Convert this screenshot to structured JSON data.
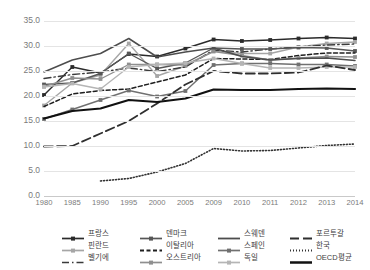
{
  "chart_data": {
    "type": "line",
    "title": "",
    "xlabel": "",
    "ylabel": "",
    "categories": [
      "1980",
      "1985",
      "1990",
      "1995",
      "2000",
      "2005",
      "2009",
      "2010",
      "2011",
      "2012",
      "2013",
      "2014"
    ],
    "ylim": [
      0,
      35
    ],
    "yticks": [
      "0.0",
      "5.0",
      "10.0",
      "15.0",
      "20.0",
      "25.0",
      "30.0",
      "35.0"
    ],
    "grid": true,
    "legend_position": "bottom",
    "series": [
      {
        "name": "프랑스",
        "color": "#2b2b2b",
        "style": "solid-marker",
        "values": [
          20.2,
          25.8,
          24.6,
          28.4,
          27.9,
          29.5,
          31.3,
          31.0,
          31.2,
          31.5,
          31.7,
          31.5
        ]
      },
      {
        "name": "핀란드",
        "color": "#a6a6a6",
        "style": "solid-marker",
        "values": [
          18.1,
          22.6,
          24.2,
          30.5,
          24.0,
          26.0,
          29.0,
          28.5,
          28.5,
          29.8,
          30.5,
          30.8
        ]
      },
      {
        "name": "벨기에",
        "color": "#3a3a3a",
        "style": "dashdot",
        "values": [
          23.5,
          24.3,
          24.8,
          25.6,
          24.9,
          25.8,
          29.2,
          28.8,
          29.4,
          29.8,
          30.2,
          30.4
        ]
      },
      {
        "name": "덴마크",
        "color": "#565656",
        "style": "solid-marker",
        "values": [
          22.3,
          22.6,
          24.5,
          28.5,
          25.5,
          26.6,
          29.6,
          29.4,
          29.4,
          29.7,
          29.6,
          29.0
        ]
      },
      {
        "name": "이탈리아",
        "color": "#1f1f1f",
        "style": "dotted-dash",
        "values": [
          17.9,
          20.4,
          21.1,
          21.4,
          22.8,
          24.2,
          27.5,
          27.4,
          27.3,
          28.1,
          28.6,
          28.6
        ]
      },
      {
        "name": "오스트리아",
        "color": "#8f8f8f",
        "style": "solid-marker",
        "values": [
          21.9,
          23.6,
          23.4,
          26.3,
          26.3,
          26.2,
          28.9,
          28.1,
          27.2,
          27.6,
          27.9,
          27.8
        ]
      },
      {
        "name": "스웨덴",
        "color": "#4d4d4d",
        "style": "solid",
        "values": [
          24.8,
          27.2,
          28.5,
          31.5,
          27.8,
          28.8,
          29.6,
          27.9,
          27.2,
          27.5,
          27.6,
          27.1
        ]
      },
      {
        "name": "스페인",
        "color": "#707070",
        "style": "solid-marker",
        "values": [
          15.4,
          17.3,
          19.2,
          21.1,
          19.9,
          21.0,
          26.2,
          26.5,
          26.5,
          26.3,
          26.3,
          26.0
        ]
      },
      {
        "name": "독일",
        "color": "#b5b5b5",
        "style": "solid-marker",
        "values": [
          21.8,
          22.5,
          21.4,
          25.8,
          26.3,
          26.6,
          27.5,
          26.5,
          25.6,
          25.6,
          25.8,
          25.8
        ]
      },
      {
        "name": "포르투갈",
        "color": "#2f2f2f",
        "style": "longdash",
        "values": [
          9.9,
          10.0,
          12.5,
          15.0,
          18.5,
          22.3,
          25.0,
          24.5,
          24.5,
          24.7,
          26.1,
          25.2
        ]
      },
      {
        "name": "한국",
        "color": "#333333",
        "style": "dotted",
        "values": [
          null,
          null,
          3.0,
          3.5,
          4.8,
          6.5,
          9.5,
          9.0,
          9.1,
          9.6,
          10.1,
          10.4
        ]
      },
      {
        "name": "OECD평균",
        "color": "#111111",
        "style": "thick-solid",
        "values": [
          15.5,
          17.0,
          17.5,
          19.2,
          18.8,
          19.5,
          21.3,
          21.2,
          21.2,
          21.4,
          21.5,
          21.4
        ]
      }
    ]
  },
  "legend_columns": [
    {
      "x": 62,
      "items": [
        "프랑스",
        "핀란드",
        "벨기에"
      ]
    },
    {
      "x": 140,
      "items": [
        "덴마크",
        "이탈리아",
        "오스트리아"
      ]
    },
    {
      "x": 218,
      "items": [
        "스웨덴",
        "스페인",
        "독일"
      ]
    },
    {
      "x": 290,
      "items": [
        "포르투갈",
        "한국",
        "OECD평균"
      ]
    }
  ]
}
